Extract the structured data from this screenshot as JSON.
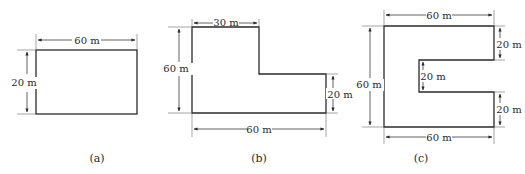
{
  "figures": [
    {
      "caption": "(a)",
      "shape": "rectangle",
      "dimensions": {
        "top_width": "60 m",
        "left_height": "20 m"
      }
    },
    {
      "caption": "(b)",
      "shape": "L-shape",
      "dimensions": {
        "top_width": "30 m",
        "left_height": "60 m",
        "right_step_height": "20 m",
        "bottom_width": "60 m"
      }
    },
    {
      "caption": "(c)",
      "shape": "C-shape",
      "dimensions": {
        "top_width": "60 m",
        "left_height": "60 m",
        "upper_arm_height": "20 m",
        "notch_height": "20 m",
        "lower_arm_height": "20 m",
        "bottom_width": "60 m"
      }
    }
  ],
  "colors": {
    "line": "#2a2a2a",
    "background": "#ffffff"
  }
}
